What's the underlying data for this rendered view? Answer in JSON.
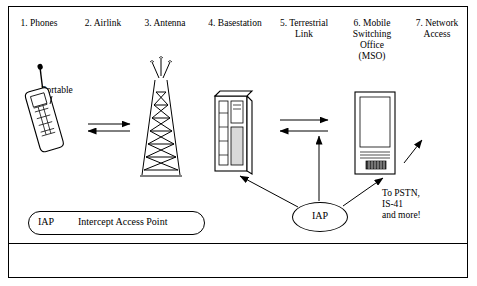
{
  "diagram": {
    "columns": [
      {
        "id": "phones",
        "label": "1. Phones",
        "x": 20,
        "y": 18
      },
      {
        "id": "airlink",
        "label": "2. Airlink",
        "x": 85,
        "y": 18
      },
      {
        "id": "antenna",
        "label": "3. Antenna",
        "x": 146,
        "y": 18
      },
      {
        "id": "basestation",
        "label": "4. Basestation",
        "x": 203,
        "y": 18
      },
      {
        "id": "terrestrial",
        "label": "5. Terrestrial\nLink",
        "x": 273,
        "y": 18
      },
      {
        "id": "mso",
        "label": "6. Mobile\nSwitching\nOffice\n(MSO)",
        "x": 348,
        "y": 18
      },
      {
        "id": "network",
        "label": "7. Network\nAccess",
        "x": 414,
        "y": 18
      }
    ],
    "labels": {
      "portable": "Portable",
      "iap_node": "IAP",
      "pstn_note": "To PSTN,\nIS-41\nand more!"
    },
    "legend": {
      "abbr": "IAP",
      "definition": "Intercept Access Point"
    },
    "colors": {
      "line": "#000000",
      "fill": "#ffffff",
      "background": "#ffffff",
      "shade": "#d9d9d9"
    }
  }
}
